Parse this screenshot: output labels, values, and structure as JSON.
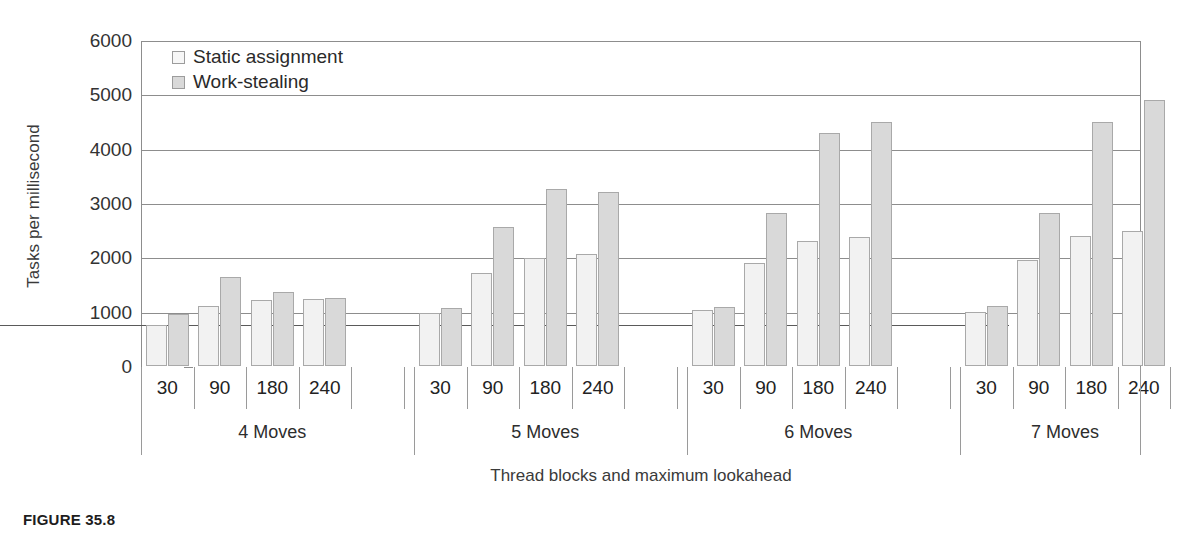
{
  "figure": {
    "caption": "FIGURE 35.8"
  },
  "legend": {
    "position": "top-left-inside",
    "items": [
      {
        "label": "Static assignment",
        "swatch": "static-assignment-swatch",
        "color": "#f2f2f2"
      },
      {
        "label": "Work-stealing",
        "swatch": "work-stealing-swatch",
        "color": "#d9d9d9"
      }
    ]
  },
  "axes": {
    "y_title": "Tasks per millisecond",
    "x_title": "Thread blocks and maximum lookahead",
    "y_ticks": [
      "0",
      "1000",
      "2000",
      "3000",
      "4000",
      "5000",
      "6000"
    ]
  },
  "chart_data": {
    "type": "bar",
    "title": "",
    "subtitle": "",
    "xlabel": "Thread blocks and maximum lookahead",
    "ylabel": "Tasks per millisecond",
    "ylim": [
      0,
      6000
    ],
    "ytick_step": 1000,
    "grid": true,
    "legend_position": "top-left-inside",
    "groups": [
      "4 Moves",
      "5 Moves",
      "6 Moves",
      "7 Moves"
    ],
    "categories": [
      "30",
      "90",
      "180",
      "240"
    ],
    "series": [
      {
        "name": "Static assignment",
        "color": "#f2f2f2",
        "values": [
          [
            760,
            1100,
            1220,
            1230
          ],
          [
            980,
            1720,
            1980,
            2070
          ],
          [
            1030,
            1900,
            2300,
            2380
          ],
          [
            1000,
            1950,
            2400,
            2480
          ]
        ]
      },
      {
        "name": "Work-stealing",
        "color": "#d9d9d9",
        "values": [
          [
            960,
            1640,
            1370,
            1260
          ],
          [
            1070,
            2550,
            3250,
            3200
          ],
          [
            1080,
            2820,
            4280,
            4500
          ],
          [
            1100,
            2820,
            4500,
            4900
          ]
        ]
      }
    ]
  }
}
